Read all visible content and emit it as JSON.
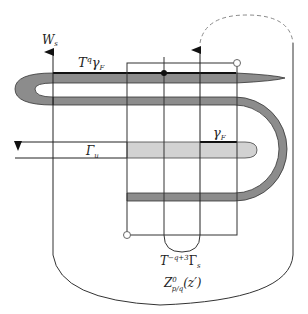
{
  "diagram": {
    "type": "topological-schematic",
    "labels": {
      "ws": "W",
      "ws_sub": "s",
      "tq_gamma": "T",
      "tq_sup": "q",
      "tq_gamma_sym": "γ",
      "tq_gamma_sub": "F",
      "gamma_f": "γ",
      "gamma_f_sub": "F",
      "gamma_u": "Γ",
      "gamma_u_sub": "u",
      "t_gamma_s": "T",
      "t_gamma_s_sup": "−q+3",
      "t_gamma_s_sym": "Γ",
      "t_gamma_s_sub": "s",
      "z": "Z",
      "z_sup": "0",
      "z_sub": "p/q",
      "z_arg": "(z′)"
    },
    "colors": {
      "stroke": "#222222",
      "dark_band": "#8c8c8c",
      "light_band": "#d2d2d2",
      "dashed": "#8a8a8a",
      "background": "#ffffff"
    }
  }
}
